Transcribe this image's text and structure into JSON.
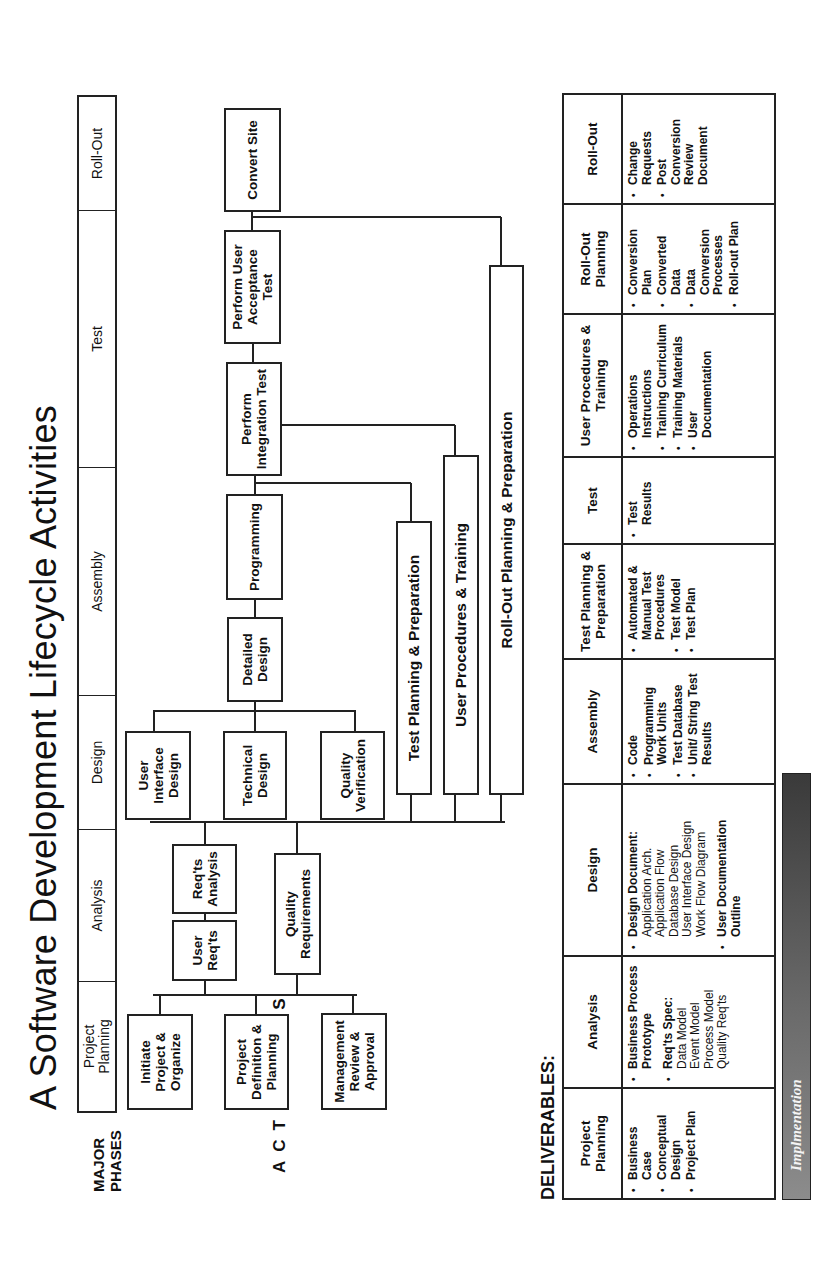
{
  "title": "A Software Development Lifecycle Activities",
  "major_phases": {
    "label_line1": "MAJOR",
    "label_line2": "PHASES",
    "phases": [
      {
        "line1": "Project",
        "line2": "Planning"
      },
      {
        "line1": "Analysis",
        "line2": ""
      },
      {
        "line1": "Design",
        "line2": ""
      },
      {
        "line1": "Assembly",
        "line2": ""
      },
      {
        "line1": "Test",
        "line2": ""
      },
      {
        "line1": "Roll-Out",
        "line2": ""
      }
    ]
  },
  "activities": {
    "label": "ACTIVITIES",
    "boxes": {
      "initiate": "Initiate Project & Organize",
      "project_definition": "Project Definition & Planning",
      "management_review": "Management Review & Approval",
      "user_reqts": "User Req'ts",
      "reqts_analysis": "Req'ts Analysis",
      "quality_requirements": "Quality Requirements",
      "user_interface_design": "User Interface Design",
      "technical_design": "Technical Design",
      "quality_verification": "Quality Verification",
      "detailed_design": "Detailed Design",
      "programming": "Programming",
      "integration_test": "Perform Integration Test",
      "user_acceptance_test": "Perform User Acceptance Test",
      "convert_site": "Convert Site",
      "test_planning": "Test Planning & Preparation",
      "user_procedures": "User Procedures & Training",
      "rollout_planning": "Roll-Out Planning & Preparation"
    }
  },
  "deliverables": {
    "label": "DELIVERABLES:",
    "columns": [
      {
        "header": "Project Planning",
        "items": [
          {
            "text": "Business Case",
            "bold": true
          },
          {
            "text": "Conceptual Design",
            "bold": true
          },
          {
            "text": "Project Plan",
            "bold": true
          }
        ]
      },
      {
        "header": "Analysis",
        "items": [
          {
            "text": "Business Process Prototype",
            "bold": true
          },
          {
            "text": "Req'ts Spec:",
            "bold": true,
            "sub": [
              "Data Model",
              "Event Model",
              "Process Model",
              "Quality Req'ts"
            ],
            "gap": true
          }
        ]
      },
      {
        "header": "Design",
        "items": [
          {
            "text": "Design Document:",
            "bold": true,
            "sub": [
              "Application Arch.",
              "Application Flow",
              "Database Design",
              "User Interface Design",
              "Work Flow Diagram"
            ]
          },
          {
            "text": "User Documentation Outline",
            "bold": true,
            "gap": true
          }
        ]
      },
      {
        "header": "Assembly",
        "items": [
          {
            "text": "Code",
            "bold": true
          },
          {
            "text": "Programming Work Units",
            "bold": true
          },
          {
            "text": "Test Database",
            "bold": true
          },
          {
            "text": "Unit/ String Test Results",
            "bold": true
          }
        ]
      },
      {
        "header": "Test Planning & Preparation",
        "items": [
          {
            "text": "Automated & Manual Test Procedures",
            "bold": true
          },
          {
            "text": "Test Model",
            "bold": true
          },
          {
            "text": "Test Plan",
            "bold": true
          }
        ]
      },
      {
        "header": "Test",
        "items": [
          {
            "text": "Test Results",
            "bold": true
          }
        ]
      },
      {
        "header": "User Procedures & Training",
        "items": [
          {
            "text": "Operations Instructions",
            "bold": true
          },
          {
            "text": "Training Curriculum",
            "bold": true
          },
          {
            "text": "Training Materials",
            "bold": true
          },
          {
            "text": "User Documentation",
            "bold": true
          }
        ]
      },
      {
        "header": "Roll-Out Planning",
        "items": [
          {
            "text": "Conversion Plan",
            "bold": true
          },
          {
            "text": "Converted Data",
            "bold": true
          },
          {
            "text": "Data Conversion Processes",
            "bold": true
          },
          {
            "text": "Roll-out Plan",
            "bold": true
          }
        ]
      },
      {
        "header": "Roll-Out",
        "items": [
          {
            "text": "Change Requests",
            "bold": true
          },
          {
            "text": "Post Conversion Review Document",
            "bold": true
          }
        ]
      }
    ]
  },
  "implementation_bar": {
    "label": "Implmentation",
    "gradient_dark": "#3a3a3a",
    "gradient_light": "#8c8c8c"
  }
}
